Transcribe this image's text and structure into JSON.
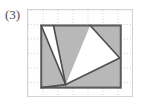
{
  "label": {
    "text": "(3)"
  },
  "panel": {
    "name": "figure-panel",
    "border_color": "#d2d2d2",
    "background": "#fefefe",
    "x": 27,
    "y": 9,
    "width": 106,
    "height": 88
  },
  "grid": {
    "color": "#b9c6d6",
    "dash": "1,2",
    "spacing_x": 15,
    "spacing_y": 14.5,
    "vertical_lines": [
      0,
      15,
      30,
      45,
      60,
      75,
      90,
      105
    ],
    "horizontal_lines": [
      0,
      14.5,
      29,
      43.5,
      58,
      72.5,
      87
    ]
  },
  "figure": {
    "type": "polygon-on-grid",
    "outline_rect": {
      "name": "bounding-rectangle",
      "x": 13,
      "y": 15,
      "width": 78,
      "height": 61,
      "stroke": "#5a5a5a",
      "stroke_width": 2,
      "fill": "#b8b8b8"
    },
    "shaded_fill": "#b8b8b8",
    "white_fill": "#ffffff",
    "stroke": "#4f4f4f",
    "stroke_width": 1.6,
    "white_regions": [
      {
        "name": "left-white-triangle",
        "points": "13,15 25,15 37,73"
      },
      {
        "name": "right-white-triangle",
        "points": "61,15 90,47 37,73"
      }
    ],
    "vertices": [
      {
        "name": "rect-top-left",
        "x": 13,
        "y": 15
      },
      {
        "name": "rect-top-right",
        "x": 91,
        "y": 15
      },
      {
        "name": "rect-bottom-right",
        "x": 91,
        "y": 76
      },
      {
        "name": "rect-bottom-left",
        "x": 13,
        "y": 76
      },
      {
        "name": "left-notch-top",
        "x": 25,
        "y": 15
      },
      {
        "name": "bottom-apex",
        "x": 37,
        "y": 73
      },
      {
        "name": "right-notch-top",
        "x": 61,
        "y": 15
      },
      {
        "name": "right-apex",
        "x": 90,
        "y": 47
      }
    ]
  }
}
